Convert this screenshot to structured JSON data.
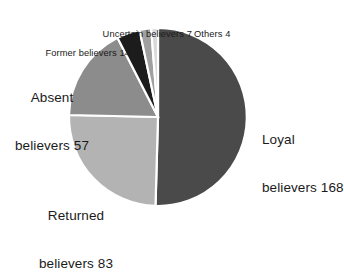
{
  "chart_data": {
    "type": "pie",
    "title": "",
    "subtitle": "",
    "xlabel": "",
    "ylabel": "",
    "legend_position": "none",
    "grid": false,
    "total": 333,
    "categories": [
      "Loyal believers",
      "Returned believers",
      "Absent believers",
      "Former believers",
      "Uncertain believers",
      "Others"
    ],
    "values": [
      168,
      83,
      57,
      14,
      7,
      4
    ],
    "colors": [
      "#4a4a4a",
      "#b3b3b3",
      "#8c8c8c",
      "#1c1c1c",
      "#a0a0a0",
      "#d9d9d9"
    ],
    "slices": [
      {
        "name": "Loyal believers",
        "value": 168,
        "color": "#4a4a4a",
        "start_angle": 0,
        "sweep_angle": 181.6,
        "label_line1": "Loyal",
        "label_line2": "believers 168",
        "label_full": "Loyal believers 168",
        "label_size": "big"
      },
      {
        "name": "Returned believers",
        "value": 83,
        "color": "#b3b3b3",
        "start_angle": 181.6,
        "sweep_angle": 89.7,
        "label_line1": "Returned",
        "label_line2": "believers 83",
        "label_full": "Returned believers 83",
        "label_size": "big"
      },
      {
        "name": "Absent believers",
        "value": 57,
        "color": "#8c8c8c",
        "start_angle": 271.3,
        "sweep_angle": 61.6,
        "label_line1": "Absent",
        "label_line2": "believers 57",
        "label_full": "Absent believers 57",
        "label_size": "big"
      },
      {
        "name": "Former believers",
        "value": 14,
        "color": "#1c1c1c",
        "start_angle": 332.9,
        "sweep_angle": 15.1,
        "label_line1": "Former believers 14",
        "label_line2": "",
        "label_full": "Former believers 14",
        "label_size": "small"
      },
      {
        "name": "Uncertain believers",
        "value": 7,
        "color": "#a0a0a0",
        "start_angle": 348.0,
        "sweep_angle": 7.6,
        "label_line1": "Uncertain believers 7",
        "label_line2": "",
        "label_full": "Uncertain believers 7",
        "label_size": "small"
      },
      {
        "name": "Others",
        "value": 4,
        "color": "#d9d9d9",
        "start_angle": 355.6,
        "sweep_angle": 4.4,
        "label_line1": "Others 4",
        "label_line2": "",
        "label_full": "Others 4",
        "label_size": "small"
      }
    ],
    "geometry": {
      "center_x": 158,
      "center_y": 117,
      "radius": 89,
      "slice_gap_color": "#ffffff",
      "slice_gap_width": 2.2
    },
    "background": "#ffffff"
  }
}
